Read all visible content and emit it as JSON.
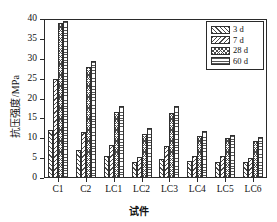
{
  "chart_data": {
    "type": "bar",
    "title": "",
    "xlabel": "试件",
    "ylabel": "抗压强度/MPa",
    "categories": [
      "C1",
      "C2",
      "LC1",
      "LC2",
      "LC3",
      "LC4",
      "LC5",
      "LC6"
    ],
    "series": [
      {
        "name": "3 d",
        "pattern": "forward-diagonal-hatch",
        "values": [
          12.0,
          7.0,
          5.5,
          4.0,
          4.8,
          4.3,
          4.1,
          4.0
        ]
      },
      {
        "name": "7 d",
        "pattern": "backward-diagonal-hatch",
        "values": [
          25.0,
          11.5,
          8.3,
          5.2,
          8.0,
          5.5,
          5.5,
          5.0
        ]
      },
      {
        "name": "28 d",
        "pattern": "cross-hatch",
        "values": [
          39.0,
          28.0,
          16.5,
          11.0,
          16.3,
          10.5,
          10.0,
          9.2
        ]
      },
      {
        "name": "60 d",
        "pattern": "horizontal-lines",
        "values": [
          39.5,
          29.5,
          18.0,
          12.5,
          18.0,
          11.7,
          10.8,
          10.2
        ]
      }
    ],
    "ylim": [
      0,
      40
    ],
    "yticks": [
      0,
      5,
      10,
      15,
      20,
      25,
      30,
      35,
      40
    ],
    "ytick_labels": [
      "0",
      "5",
      "10",
      "15",
      "20",
      "25",
      "30",
      "35",
      "40"
    ],
    "grid": false,
    "legend_position": "top-right",
    "legend_entries": [
      "3 d",
      "7 d",
      "28 d",
      "60 d"
    ]
  }
}
